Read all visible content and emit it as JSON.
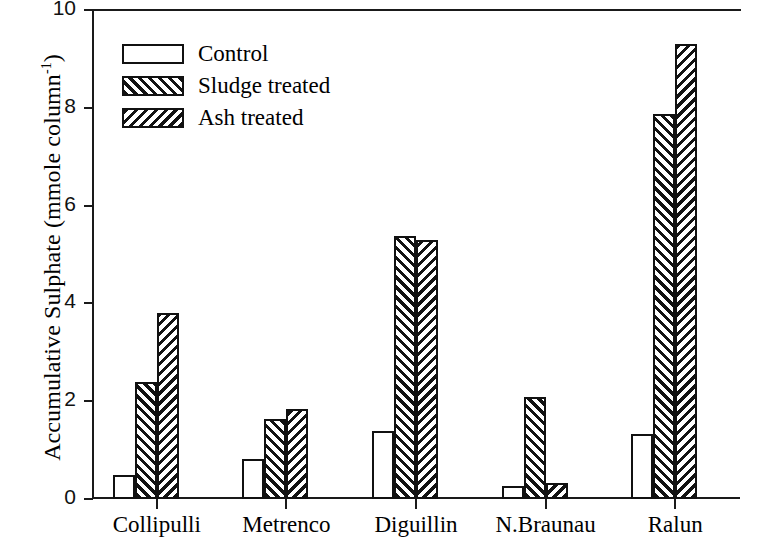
{
  "chart_data": {
    "type": "bar",
    "title": "",
    "xlabel": "",
    "ylabel": "Accumulative Sulphate (mmole column",
    "ylabel_superscript": "-1",
    "ylabel_suffix": ")",
    "categories": [
      "Collipulli",
      "Metrenco",
      "Diguillin",
      "N.Braunau",
      "Ralun"
    ],
    "series": [
      {
        "name": "Control",
        "fill": "none",
        "values": [
          0.5,
          0.82,
          1.4,
          0.26,
          1.33
        ]
      },
      {
        "name": "Sludge treated",
        "fill": "forward-hatch",
        "values": [
          2.4,
          1.63,
          5.37,
          2.08,
          7.87
        ]
      },
      {
        "name": "Ash treated",
        "fill": "backward-hatch",
        "values": [
          3.8,
          1.85,
          5.29,
          0.33,
          9.3
        ]
      }
    ],
    "ylim": [
      0,
      10
    ],
    "yticks": [
      0,
      2,
      4,
      6,
      8,
      10
    ],
    "ytick_labels": [
      "0",
      "2",
      "4",
      "6",
      "8",
      "10"
    ],
    "grid": false,
    "legend_position": "top-left",
    "axis_color": "#1a1a1a",
    "bar_edge_color": "#111111",
    "hatch_color": "#121212",
    "background": "#ffffff"
  },
  "legend": {
    "entries": [
      {
        "label": "Control"
      },
      {
        "label": "Sludge treated"
      },
      {
        "label": "Ash treated"
      }
    ]
  }
}
